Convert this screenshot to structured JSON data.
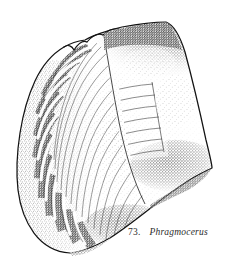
{
  "figure": {
    "caption_number": "73.",
    "caption_name": "Phragmocerus",
    "technique": "stipple-and-line-engraving",
    "ink_color": "#1a1a1a",
    "background_color": "#ffffff",
    "specimen": {
      "orientation": "apex-right",
      "outline_points": "85,40 100,33 120,28 142,25 163,22 176,30 186,52 196,90 205,128 212,168 198,176 184,185 170,196 152,208 133,221 112,236 92,247 72,253 54,250 38,238 26,220 19,196 18,170 20,142 24,116 32,92 44,70 60,54 72,45",
      "rib_count": 13,
      "growth_line_count": 14,
      "septal_line_count": 7,
      "shading_zones": [
        "upper-right-dorsal",
        "left-rib-crests",
        "lower-right-margin"
      ]
    }
  }
}
